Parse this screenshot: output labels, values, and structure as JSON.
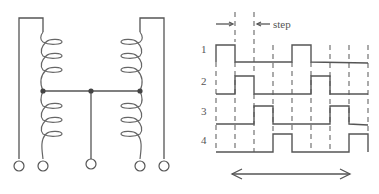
{
  "circuit": {
    "description": "Two center-tapped coils joined by a common wire with five terminals",
    "terminals": 5,
    "junction_dots": 3
  },
  "timing": {
    "step_label": "step",
    "phase_labels": [
      "1",
      "2",
      "3",
      "4"
    ],
    "phases": [
      {
        "label": "1",
        "pulses": [
          [
            0,
            1
          ],
          [
            4,
            5
          ]
        ]
      },
      {
        "label": "2",
        "pulses": [
          [
            1,
            2
          ],
          [
            5,
            6
          ]
        ]
      },
      {
        "label": "3",
        "pulses": [
          [
            2,
            3
          ],
          [
            6,
            7
          ]
        ]
      },
      {
        "label": "4",
        "pulses": [
          [
            3,
            4
          ],
          [
            7,
            8
          ]
        ]
      }
    ],
    "steps": 8,
    "direction_arrow": "bidirectional"
  },
  "colors": {
    "line": "#555555",
    "background": "#ffffff"
  }
}
